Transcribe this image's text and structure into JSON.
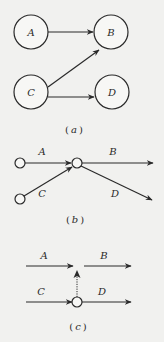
{
  "colors": {
    "background": "#f1f1ef",
    "stroke": "#2a2a2a"
  },
  "figure_a": {
    "caption_open": "(",
    "caption_letter": "a",
    "caption_close": ")",
    "nodes": [
      {
        "id": "A",
        "label": "A"
      },
      {
        "id": "B",
        "label": "B"
      },
      {
        "id": "C",
        "label": "C"
      },
      {
        "id": "D",
        "label": "D"
      }
    ],
    "edges": [
      {
        "from": "A",
        "to": "B"
      },
      {
        "from": "C",
        "to": "B"
      },
      {
        "from": "C",
        "to": "D"
      }
    ]
  },
  "figure_b": {
    "caption_open": "(",
    "caption_letter": "b",
    "caption_close": ")",
    "arcs": [
      {
        "label": "A"
      },
      {
        "label": "B"
      },
      {
        "label": "C"
      },
      {
        "label": "D"
      }
    ]
  },
  "figure_c": {
    "caption_open": "(",
    "caption_letter": "c",
    "caption_close": ")",
    "arcs": [
      {
        "label": "A"
      },
      {
        "label": "B"
      },
      {
        "label": "C"
      },
      {
        "label": "D"
      }
    ],
    "dummy_arrow": "dotted"
  }
}
